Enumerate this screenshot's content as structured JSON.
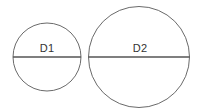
{
  "canvas": {
    "width": 199,
    "height": 111,
    "background_color": "#ffffff"
  },
  "style": {
    "circle_stroke_color": "#6a6a6a",
    "circle_stroke_width": 1,
    "diameter_stroke_color": "#555555",
    "diameter_stroke_width": 1.6,
    "label_color": "#333333",
    "label_font_size": 11
  },
  "figures": [
    {
      "id": "small-circle",
      "label": "D1",
      "center_x": 47,
      "center_y": 57,
      "radius": 34,
      "diameter": 68,
      "label_x": 47,
      "label_y": 54
    },
    {
      "id": "large-circle",
      "label": "D2",
      "center_x": 139,
      "center_y": 57,
      "radius": 50.5,
      "diameter": 101,
      "label_x": 140,
      "label_y": 54
    }
  ]
}
